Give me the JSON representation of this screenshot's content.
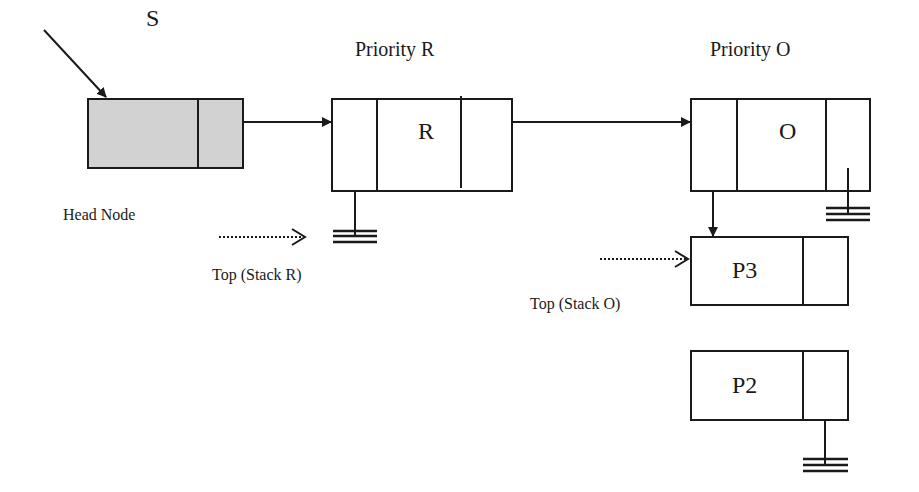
{
  "diagram": {
    "type": "linked priority stacks",
    "colors": {
      "stroke": "#1a1a1a",
      "head_fill": "#d2d2d2",
      "node_fill": "#ffffff"
    },
    "labels": {
      "start_pointer": "S",
      "head_node": "Head Node",
      "priority_r": "Priority R",
      "priority_o": "Priority O",
      "top_stack_r": "Top (Stack R)",
      "top_stack_o": "Top (Stack O)"
    },
    "nodes": [
      {
        "id": "head",
        "label": "",
        "fields": 2
      },
      {
        "id": "priority-r",
        "label": "R",
        "fields": 3,
        "next": "priority-o",
        "stack": null
      },
      {
        "id": "priority-o",
        "label": "O",
        "fields": 3,
        "next": null,
        "stack": "p3"
      },
      {
        "id": "p3",
        "label": "P3",
        "fields": 2
      },
      {
        "id": "p2",
        "label": "P2",
        "fields": 2,
        "next": null
      }
    ]
  }
}
